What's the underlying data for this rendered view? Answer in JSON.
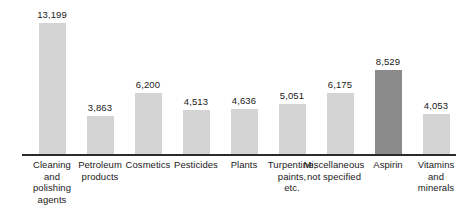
{
  "chart_data": {
    "type": "bar",
    "title": "",
    "subtitle": "",
    "xlabel": "",
    "ylabel": "",
    "ylim": [
      0,
      13199
    ],
    "grid": false,
    "legend": "none",
    "axis": {
      "baseline_visible": true,
      "y_axis_visible": false,
      "ticks": []
    },
    "categories": [
      "Cleaning and polishing agents",
      "Petroleum products",
      "Cosmetics",
      "Pesticides",
      "Plants",
      "Turpentine, paints, etc.",
      "Miscellaneous not specified",
      "Aspirin",
      "Vitamins and minerals"
    ],
    "values": [
      13199,
      3863,
      6200,
      4513,
      4636,
      5051,
      6175,
      8529,
      4053
    ],
    "value_labels": [
      "13,199",
      "3,863",
      "6,200",
      "4,513",
      "4,636",
      "5,051",
      "6,175",
      "8,529",
      "4,053"
    ],
    "highlight_category": "Aspirin",
    "colors": {
      "bar": "#d4d4d4",
      "bar_highlight": "#8b8b8b",
      "axis": "#2b2b2b",
      "text": "#1a1a1a",
      "background": "#ffffff"
    }
  },
  "bars": [
    {
      "value_label": "13,199",
      "value": 13199,
      "left": 28,
      "height": 132,
      "highlight": false,
      "label_lines": [
        "Cleaning",
        "and",
        "polishing",
        "agents"
      ],
      "label_left": 21
    },
    {
      "value_label": "3,863",
      "value": 3863,
      "left": 76,
      "height": 39,
      "highlight": false,
      "label_lines": [
        "Petroleum",
        "products"
      ],
      "label_left": 69
    },
    {
      "value_label": "6,200",
      "value": 6200,
      "left": 124,
      "height": 62,
      "highlight": false,
      "label_lines": [
        "Cosmetics"
      ],
      "label_left": 117
    },
    {
      "value_label": "4,513",
      "value": 4513,
      "left": 172,
      "height": 45,
      "highlight": false,
      "label_lines": [
        "Pesticides"
      ],
      "label_left": 165
    },
    {
      "value_label": "4,636",
      "value": 4636,
      "left": 220,
      "height": 46,
      "highlight": false,
      "label_lines": [
        "Plants"
      ],
      "label_left": 213
    },
    {
      "value_label": "5,051",
      "value": 5051,
      "left": 268,
      "height": 51,
      "highlight": false,
      "label_lines": [
        "Turpentine,",
        "paints,",
        "etc."
      ],
      "label_left": 261
    },
    {
      "value_label": "6,175",
      "value": 6175,
      "left": 316,
      "height": 62,
      "highlight": false,
      "label_lines": [
        "Miscellaneous",
        "not specified"
      ],
      "label_left": 303
    },
    {
      "value_label": "8,529",
      "value": 8529,
      "left": 364,
      "height": 85,
      "highlight": true,
      "label_lines": [
        "Aspirin"
      ],
      "label_left": 357
    },
    {
      "value_label": "4,053",
      "value": 4053,
      "left": 412,
      "height": 41,
      "highlight": false,
      "label_lines": [
        "Vitamins",
        "and",
        "minerals"
      ],
      "label_left": 405
    }
  ]
}
